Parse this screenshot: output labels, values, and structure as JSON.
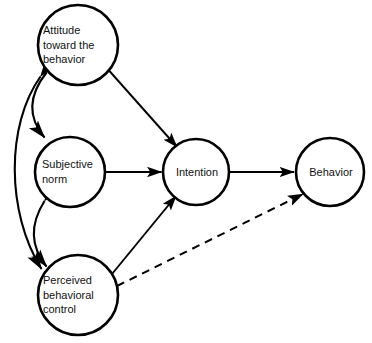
{
  "diagram": {
    "type": "path-diagram",
    "background_color": "#ffffff",
    "stroke_color": "#000000",
    "text_color": "#111111",
    "nodes": [
      {
        "id": "attitude",
        "label": "Attitude\ntoward the\nbehavior",
        "shape": "circle",
        "cx": 78,
        "cy": 45,
        "r": 40
      },
      {
        "id": "subjective_norm",
        "label": "Subjective\nnorm",
        "shape": "circle",
        "cx": 70,
        "cy": 172,
        "r": 35
      },
      {
        "id": "perceived_behavioral_control",
        "label": "Perceived\nbehavioral\ncontrol",
        "shape": "circle",
        "cx": 78,
        "cy": 295,
        "r": 40
      },
      {
        "id": "intention",
        "label": "Intention",
        "shape": "circle",
        "cx": 196,
        "cy": 172,
        "r": 33
      },
      {
        "id": "behavior",
        "label": "Behavior",
        "shape": "circle",
        "cx": 330,
        "cy": 172,
        "r": 34
      }
    ],
    "edges": [
      {
        "id": "attitude-to-intention",
        "from": "attitude",
        "to": "intention",
        "style": "solid",
        "arrow": "single"
      },
      {
        "id": "subjective-norm-to-intention",
        "from": "subjective_norm",
        "to": "intention",
        "style": "solid",
        "arrow": "single"
      },
      {
        "id": "pbc-to-intention",
        "from": "perceived_behavioral_control",
        "to": "intention",
        "style": "solid",
        "arrow": "single"
      },
      {
        "id": "intention-to-behavior",
        "from": "intention",
        "to": "behavior",
        "style": "solid",
        "arrow": "single"
      },
      {
        "id": "pbc-to-behavior",
        "from": "perceived_behavioral_control",
        "to": "behavior",
        "style": "dashed",
        "arrow": "single"
      },
      {
        "id": "attitude-subjective-norm-correlation",
        "from": "attitude",
        "to": "subjective_norm",
        "style": "curved",
        "arrow": "double"
      },
      {
        "id": "subjective-norm-pbc-correlation",
        "from": "subjective_norm",
        "to": "perceived_behavioral_control",
        "style": "curved",
        "arrow": "double"
      },
      {
        "id": "attitude-pbc-correlation",
        "from": "attitude",
        "to": "perceived_behavioral_control",
        "style": "curved",
        "arrow": "double"
      }
    ]
  }
}
